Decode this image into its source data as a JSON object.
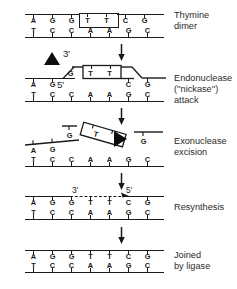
{
  "figure": {
    "ink_color": "#1a1a1a",
    "background": "#ffffff"
  },
  "bases": {
    "top_strand": [
      "A",
      "G",
      "G",
      "T",
      "T",
      "C",
      "G"
    ],
    "bottom_strand": [
      "T",
      "C",
      "C",
      "A",
      "A",
      "G",
      "C"
    ],
    "dimer_bases": [
      "T",
      "T"
    ],
    "dimer_positions": [
      3,
      4
    ]
  },
  "panels": [
    {
      "id": "panel-thymine-dimer",
      "label": "Thymine\ndimer",
      "label_lines": [
        "Thymine",
        "dimer"
      ],
      "top_bases": [
        "A",
        "G",
        "G",
        "T",
        "T",
        "C",
        "G"
      ],
      "bottom_bases": [
        "T",
        "C",
        "C",
        "A",
        "A",
        "G",
        "C"
      ],
      "dimer_boxed": true,
      "primes": [],
      "enzymes": []
    },
    {
      "id": "panel-endonuclease-attack",
      "label": "Endonuclease\n(''nickase'')\nattack",
      "label_lines": [
        "Endonuclease",
        "(''nickase'')",
        "attack"
      ],
      "top_bases": [
        "A",
        "G",
        "G",
        "T",
        "T",
        "C",
        "G"
      ],
      "bottom_bases": [
        "T",
        "C",
        "C",
        "A",
        "A",
        "G",
        "C"
      ],
      "dimer_boxed": true,
      "dimer_lifted": true,
      "primes": [
        "3'",
        "5'"
      ],
      "enzymes": [
        "triangle-up"
      ]
    },
    {
      "id": "panel-exonuclease-excision",
      "label": "Exonuclease\nexcision",
      "label_lines": [
        "Exonuclease",
        "excision"
      ],
      "top_bases": [
        "A",
        "G",
        "G",
        "T",
        "T",
        "G"
      ],
      "bottom_bases": [
        "T",
        "C",
        "C",
        "A",
        "A",
        "G",
        "C"
      ],
      "dimer_boxed": true,
      "dimer_excised": true,
      "primes": [],
      "enzymes": [
        "triangle-right"
      ]
    },
    {
      "id": "panel-resynthesis",
      "label": "Resynthesis",
      "label_lines": [
        "Resynthesis"
      ],
      "top_bases": [
        "A",
        "G",
        "G",
        "T",
        "T",
        "C",
        "G"
      ],
      "bottom_bases": [
        "T",
        "C",
        "C",
        "A",
        "A",
        "G",
        "C"
      ],
      "new_strand_dashed": true,
      "primes": [
        "3'",
        "5'"
      ],
      "enzymes": []
    },
    {
      "id": "panel-joined-by-ligase",
      "label": "Joined\nby ligase",
      "label_lines": [
        "Joined",
        "by ligase"
      ],
      "top_bases": [
        "A",
        "G",
        "G",
        "T",
        "T",
        "C",
        "G"
      ],
      "bottom_bases": [
        "T",
        "C",
        "C",
        "A",
        "A",
        "G",
        "C"
      ],
      "repaired": true,
      "primes": [],
      "enzymes": []
    }
  ],
  "labels": {
    "thymine_dimer_l1": "Thymine",
    "thymine_dimer_l2": "dimer",
    "endonuclease_l1": "Endonuclease",
    "endonuclease_l2": "(''nickase'')",
    "endonuclease_l3": "attack",
    "exonuclease_l1": "Exonuclease",
    "exonuclease_l2": "excision",
    "resynthesis_l1": "Resynthesis",
    "ligase_l1": "Joined",
    "ligase_l2": "by ligase"
  },
  "primes": {
    "three_prime": "3'",
    "five_prime": "5'"
  },
  "p1": {
    "t": [
      "A",
      "G",
      "G",
      "T",
      "T",
      "C",
      "G"
    ],
    "b": [
      "T",
      "C",
      "C",
      "A",
      "A",
      "G",
      "C"
    ]
  },
  "p2": {
    "t": [
      "A",
      "G",
      "G",
      "T",
      "T",
      "C",
      "G"
    ],
    "b": [
      "T",
      "C",
      "C",
      "A",
      "A",
      "G",
      "C"
    ]
  },
  "p3": {
    "t": [
      "A",
      "G",
      "G",
      "T",
      "T",
      "G"
    ],
    "b": [
      "T",
      "C",
      "C",
      "A",
      "A",
      "G",
      "C"
    ]
  },
  "p4": {
    "t": [
      "A",
      "G",
      "G",
      "T",
      "T",
      "C",
      "G"
    ],
    "b": [
      "T",
      "C",
      "C",
      "A",
      "A",
      "G",
      "C"
    ]
  },
  "p5": {
    "t": [
      "A",
      "G",
      "G",
      "T",
      "T",
      "C",
      "G"
    ],
    "b": [
      "T",
      "C",
      "C",
      "A",
      "A",
      "G",
      "C"
    ]
  }
}
